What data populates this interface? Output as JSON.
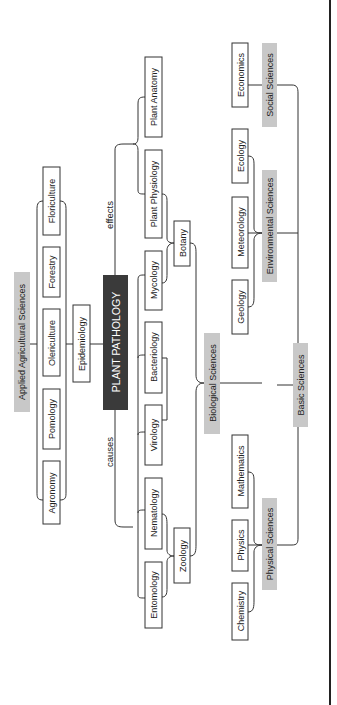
{
  "diagram": {
    "center": "PLANT PATHOLOGY",
    "edge_labels": {
      "effects": "effects",
      "causes": "causes"
    },
    "applied": {
      "label": "Applied Agricultural Sciences",
      "items": [
        "Floriculture",
        "Forestry",
        "Olericulture",
        "Pomology",
        "Agronomy"
      ],
      "bridge": "Epidemiology"
    },
    "sciences": {
      "plant": [
        "Plant Anatomy",
        "Plant Physiology",
        "Mycology"
      ],
      "micro": [
        "Bacteriology",
        "Virology"
      ],
      "animal": [
        "Nematology",
        "Entomology"
      ],
      "botany": "Botany",
      "zoology": "Zoology",
      "biological": "Biological Sciences"
    },
    "basic": {
      "label": "Basic Sciences",
      "social": {
        "label": "Social Sciences",
        "items": [
          "Economics"
        ]
      },
      "environmental": {
        "label": "Environmental Sciences",
        "items": [
          "Ecology",
          "Meteorology",
          "Geology"
        ]
      },
      "physical": {
        "label": "Physical Sciences",
        "items": [
          "Mathematics",
          "Physics",
          "Chemistry"
        ]
      }
    }
  }
}
